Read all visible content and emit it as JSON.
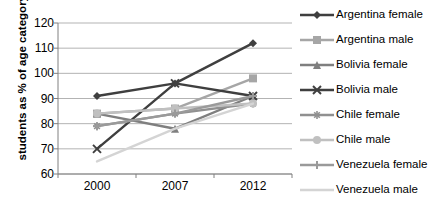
{
  "chart_data": {
    "type": "line",
    "title": "",
    "xlabel": "",
    "ylabel": "students as % of age category",
    "categories": [
      "2000",
      "2007",
      "2012"
    ],
    "x": [
      2000,
      2007,
      2012
    ],
    "ylim": [
      60,
      120
    ],
    "yticks": [
      60,
      70,
      80,
      90,
      100,
      110,
      120
    ],
    "grid": true,
    "legend_position": "right",
    "series": [
      {
        "name": "Argentina female",
        "values": [
          91,
          96,
          112
        ],
        "color": "#3f3f3f",
        "marker": "diamond"
      },
      {
        "name": "Argentina male",
        "values": [
          84,
          86,
          98
        ],
        "color": "#a6a6a6",
        "marker": "square"
      },
      {
        "name": "Bolivia female",
        "values": [
          84,
          78,
          91
        ],
        "color": "#7f7f7f",
        "marker": "triangle"
      },
      {
        "name": "Bolivia male",
        "values": [
          70,
          96,
          91
        ],
        "color": "#3f3f3f",
        "marker": "x"
      },
      {
        "name": "Chile female",
        "values": [
          79,
          84,
          88
        ],
        "color": "#909090",
        "marker": "asterisk"
      },
      {
        "name": "Chile male",
        "values": [
          84,
          86,
          88
        ],
        "color": "#c0c0c0",
        "marker": "circle"
      },
      {
        "name": "Venezuela female",
        "values": [
          79,
          84,
          91
        ],
        "color": "#9a9a9a",
        "marker": "plus"
      },
      {
        "name": "Venezuela male",
        "values": [
          65,
          78,
          88
        ],
        "color": "#d4d4d4",
        "marker": "none"
      }
    ]
  },
  "axis": {
    "y_title": "students as % of age category",
    "y_ticks": [
      "120",
      "110",
      "100",
      "90",
      "80",
      "70",
      "60"
    ],
    "x_ticks": [
      "2000",
      "2007",
      "2012"
    ]
  },
  "legend": {
    "items": [
      {
        "label": "Argentina female"
      },
      {
        "label": "Argentina male"
      },
      {
        "label": "Bolivia female"
      },
      {
        "label": "Bolivia male"
      },
      {
        "label": "Chile female"
      },
      {
        "label": "Chile male"
      },
      {
        "label": "Venezuela female"
      },
      {
        "label": "Venezuela male"
      }
    ]
  },
  "colors": {
    "grid": "#b3b3b3",
    "axis": "#808080",
    "text": "#000000",
    "background": "#ffffff"
  }
}
